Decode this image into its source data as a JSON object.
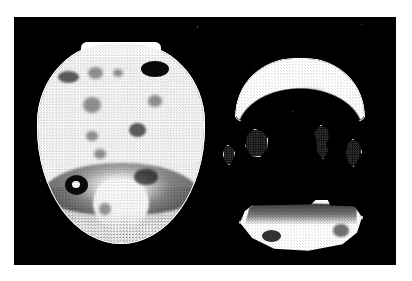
{
  "figure": {
    "title": "Greyscale tomographic scan figure",
    "page_background": "#ffffff",
    "panel_background": "#000000",
    "contour_color": "#ffffff",
    "tissue_color": "#ffffff",
    "lesion_color": "#0a0a0a",
    "panel": {
      "x": 14,
      "y": 17,
      "width": 382,
      "height": 248
    },
    "caption": "",
    "annotations": []
  },
  "objects": {
    "axial_slice": {
      "name": "axial brain slice",
      "description": "Large oval slice with flattened crown, bright white parenchyma, stair-stepped white contour, scattered dark focal spots and a dark inferior band",
      "lesion_count": 11
    },
    "crescent": {
      "name": "superior crescent segment",
      "description": "Bright arc-shaped band with darker central shading and white outline"
    },
    "small_blobs": {
      "name": "isolated outlined regions",
      "count": 4,
      "description": "Four small dark speckled regions each traced with a white contour"
    },
    "inferior_slab": {
      "name": "inferior elongated slab",
      "description": "Wide horizontal region, dark band across its upper edge, bright lower body, white contour"
    }
  },
  "lesions": [
    {
      "id": "les-1",
      "left": "12%",
      "top": "14%",
      "width": "13%",
      "height": "6%",
      "class": "soft"
    },
    {
      "id": "les-2",
      "left": "30%",
      "top": "12%",
      "width": "9%",
      "height": "6%",
      "class": "faint"
    },
    {
      "id": "les-3",
      "left": "45%",
      "top": "13%",
      "width": "6%",
      "height": "4%",
      "class": "faint"
    },
    {
      "id": "les-4",
      "left": "62%",
      "top": "9%",
      "width": "17%",
      "height": "8%",
      "class": ""
    },
    {
      "id": "les-5",
      "left": "27%",
      "top": "27%",
      "width": "11%",
      "height": "8%",
      "class": "faint"
    },
    {
      "id": "les-6",
      "left": "66%",
      "top": "26%",
      "width": "9%",
      "height": "6%",
      "class": "faint"
    },
    {
      "id": "les-7",
      "left": "55%",
      "top": "40%",
      "width": "10%",
      "height": "7%",
      "class": "soft"
    },
    {
      "id": "les-8",
      "left": "29%",
      "top": "44%",
      "width": "7%",
      "height": "5%",
      "class": "faint"
    },
    {
      "id": "les-9",
      "left": "34%",
      "top": "53%",
      "width": "7%",
      "height": "5%",
      "class": "faint"
    },
    {
      "id": "les-10",
      "left": "16%",
      "top": "66%",
      "width": "14%",
      "height": "10%",
      "class": "pitted"
    },
    {
      "id": "les-11",
      "left": "58%",
      "top": "63%",
      "width": "14%",
      "height": "8%",
      "class": "soft"
    },
    {
      "id": "les-12",
      "left": "37%",
      "top": "80%",
      "width": "7%",
      "height": "6%",
      "class": "faint"
    }
  ],
  "blobs": [
    {
      "id": "blob-left",
      "label": "blob-lower-left"
    },
    {
      "id": "blob-inner",
      "label": "blob-inner-left"
    },
    {
      "id": "blob-right",
      "label": "blob-inner-right"
    },
    {
      "id": "blob-far-right",
      "label": "blob-outer-right"
    }
  ]
}
